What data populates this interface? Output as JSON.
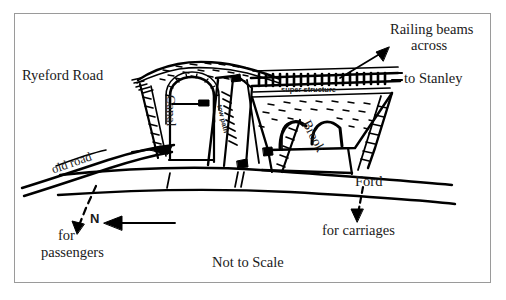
{
  "figure": {
    "title_note": "Not to Scale",
    "border_color": "#9a9a9a",
    "ink_color": "#000000",
    "background_color": "#ffffff"
  },
  "labels": {
    "ryeford_road": "Ryeford Road",
    "to_stanley": "to Stanley",
    "railing_beams": "Railing beams",
    "across": "across",
    "super_structure": "super structure",
    "canal": "Canal",
    "tow_path": "tow path",
    "brook": "Brook",
    "old_road": "old road",
    "ford": "Ford",
    "for_carriages": "for carriages",
    "for": "for",
    "passengers": "passengers",
    "north": "N",
    "not_to_scale": "Not to Scale"
  },
  "annotations": {
    "railing_arrow": "arrow pointing from Railing beams text down-left to the railing on the bridge deck",
    "ford_arrow": "dashed arrow pointing down from Ford to for carriages",
    "passenger_arrow": "dashed arrow pointing down-left to for passengers",
    "north_arrow": "solid arrow pointing left toward the letter N"
  }
}
